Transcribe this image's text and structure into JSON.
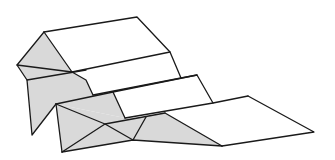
{
  "diagram": {
    "colors": {
      "background": "#ffffff",
      "shaded_face": "#d9d9d9",
      "white_face": "#ffffff",
      "edge": "#1a1a1a"
    },
    "elements": [
      {
        "name": "upper-top-face",
        "tone": "white"
      },
      {
        "name": "upper-end-triangle",
        "tone": "shaded"
      },
      {
        "name": "upper-front-flap",
        "tone": "shaded"
      },
      {
        "name": "middle-step-face",
        "tone": "white"
      },
      {
        "name": "lower-end-envelope",
        "tone": "shaded"
      },
      {
        "name": "lower-center-triangle",
        "tone": "shaded"
      },
      {
        "name": "lower-flat-face",
        "tone": "white"
      }
    ]
  }
}
